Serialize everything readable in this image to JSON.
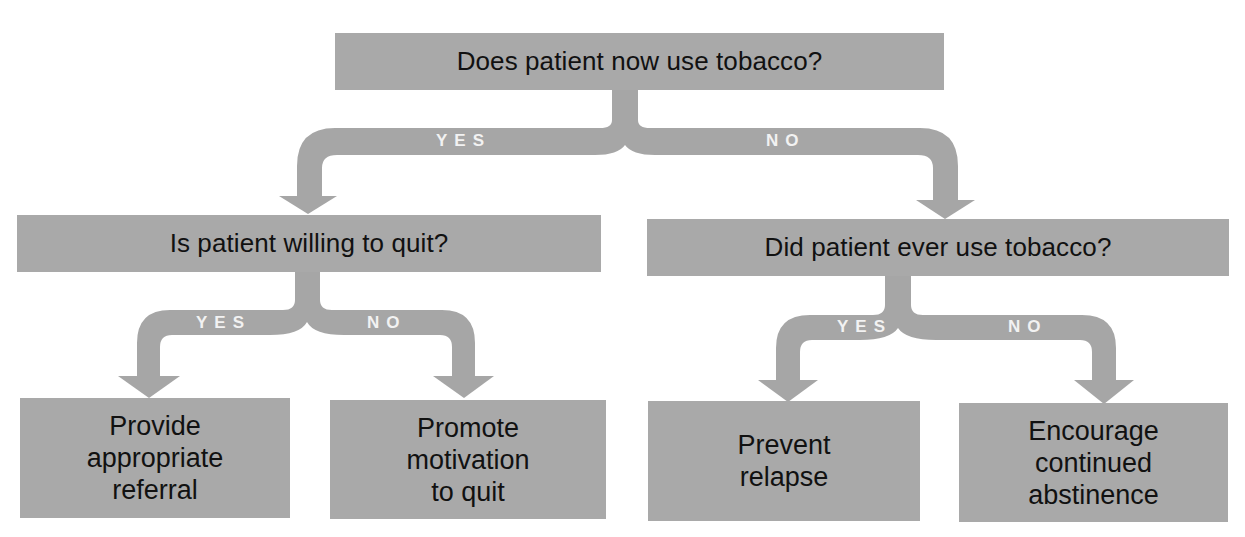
{
  "diagram": {
    "type": "decision-tree",
    "colors": {
      "box": "#a9a9a9",
      "arrow": "#a6a6a6",
      "label": "#f2f2f2",
      "text": "#111111",
      "background": "#ffffff"
    },
    "root": {
      "question": "Does patient now use tobacco?",
      "yes_label": "YES",
      "no_label": "NO"
    },
    "left_branch": {
      "question": "Is patient willing to quit?",
      "yes_label": "YES",
      "no_label": "NO",
      "yes_outcome": [
        "Provide",
        "appropriate",
        "referral"
      ],
      "no_outcome": [
        "Promote",
        "motivation",
        "to quit"
      ]
    },
    "right_branch": {
      "question": "Did patient ever use tobacco?",
      "yes_label": "YES",
      "no_label": "NO",
      "yes_outcome": [
        "Prevent",
        "relapse"
      ],
      "no_outcome": [
        "Encourage",
        "continued",
        "abstinence"
      ]
    }
  }
}
